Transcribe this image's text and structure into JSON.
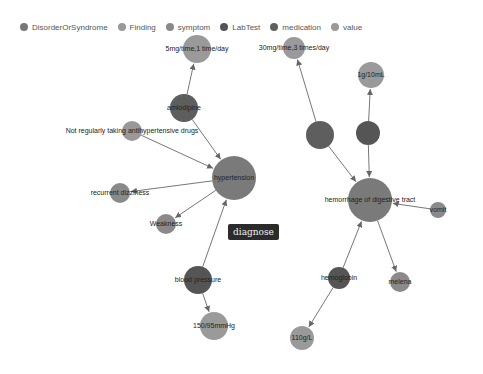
{
  "legend": [
    {
      "label": "DisorderOrSyndrome",
      "color": "#777777"
    },
    {
      "label": "Finding",
      "color": "#999999"
    },
    {
      "label": "symptom",
      "color": "#8a8a8a"
    },
    {
      "label": "LabTest",
      "color": "#555555"
    },
    {
      "label": "medication",
      "color": "#606060"
    },
    {
      "label": "value",
      "color": "#9a9a9a"
    }
  ],
  "tooltip": {
    "label": "diagnose",
    "x": 228,
    "y": 224
  },
  "nodes": [
    {
      "id": "hypertension",
      "label": "hypertension",
      "type": "DisorderOrSyndrome",
      "x": 234,
      "y": 178,
      "r": 22,
      "color": "#7a7a7a"
    },
    {
      "id": "amlodipine",
      "label": "amlodipine",
      "type": "medication",
      "x": 184,
      "y": 108,
      "r": 14,
      "color": "#5e5e5e"
    },
    {
      "id": "dose1",
      "label": "5mg/time,1 time/day",
      "type": "value",
      "x": 197,
      "y": 49,
      "r": 14,
      "color": "#9a9a9a"
    },
    {
      "id": "nonadherence",
      "label": "Not regularly taking antihypertensive drugs",
      "type": "Finding",
      "x": 132,
      "y": 131,
      "r": 10,
      "color": "#999999"
    },
    {
      "id": "dizziness",
      "label": "recurrent dizziness",
      "type": "symptom",
      "x": 120,
      "y": 193,
      "r": 10,
      "color": "#8a8a8a"
    },
    {
      "id": "weakness",
      "label": "Weakness",
      "type": "symptom",
      "x": 166,
      "y": 224,
      "r": 10,
      "color": "#8a8a8a"
    },
    {
      "id": "bp",
      "label": "blood pressure",
      "type": "LabTest",
      "x": 198,
      "y": 280,
      "r": 14,
      "color": "#555555"
    },
    {
      "id": "bpval",
      "label": "150/95mmHg",
      "type": "value",
      "x": 214,
      "y": 326,
      "r": 14,
      "color": "#9a9a9a"
    },
    {
      "id": "hemorrhage",
      "label": "hemorrhage of digestive tract",
      "type": "DisorderOrSyndrome",
      "x": 370,
      "y": 200,
      "r": 22,
      "color": "#7a7a7a"
    },
    {
      "id": "med2",
      "label": "",
      "type": "medication",
      "x": 320,
      "y": 135,
      "r": 14,
      "color": "#5e5e5e"
    },
    {
      "id": "med3",
      "label": "",
      "type": "medication",
      "x": 368,
      "y": 133,
      "r": 12,
      "color": "#555555"
    },
    {
      "id": "dose2",
      "label": "30mg/time,3 times/day",
      "type": "value",
      "x": 294,
      "y": 48,
      "r": 11,
      "color": "#9a9a9a"
    },
    {
      "id": "dose3",
      "label": "1g/10mL",
      "type": "value",
      "x": 371,
      "y": 75,
      "r": 13,
      "color": "#9a9a9a"
    },
    {
      "id": "symptom2",
      "label": "vomit",
      "type": "symptom",
      "x": 438,
      "y": 210,
      "r": 8,
      "color": "#8a8a8a"
    },
    {
      "id": "hemoglobin",
      "label": "hemoglobin",
      "type": "LabTest",
      "x": 339,
      "y": 278,
      "r": 11,
      "color": "#555555"
    },
    {
      "id": "melena",
      "label": "melena",
      "type": "symptom",
      "x": 400,
      "y": 282,
      "r": 10,
      "color": "#8a8a8a"
    },
    {
      "id": "hbval",
      "label": "110g/L",
      "type": "value",
      "x": 302,
      "y": 338,
      "r": 12,
      "color": "#9a9a9a"
    }
  ],
  "links": [
    {
      "source": "amlodipine",
      "target": "dose1"
    },
    {
      "source": "amlodipine",
      "target": "hypertension"
    },
    {
      "source": "nonadherence",
      "target": "hypertension"
    },
    {
      "source": "hypertension",
      "target": "dizziness"
    },
    {
      "source": "hypertension",
      "target": "weakness"
    },
    {
      "source": "bp",
      "target": "hypertension"
    },
    {
      "source": "bp",
      "target": "bpval"
    },
    {
      "source": "med2",
      "target": "dose2"
    },
    {
      "source": "med3",
      "target": "dose3"
    },
    {
      "source": "med2",
      "target": "hemorrhage"
    },
    {
      "source": "med3",
      "target": "hemorrhage"
    },
    {
      "source": "symptom2",
      "target": "hemorrhage"
    },
    {
      "source": "hemoglobin",
      "target": "hemorrhage"
    },
    {
      "source": "hemorrhage",
      "target": "melena"
    },
    {
      "source": "hemoglobin",
      "target": "hbval"
    }
  ]
}
